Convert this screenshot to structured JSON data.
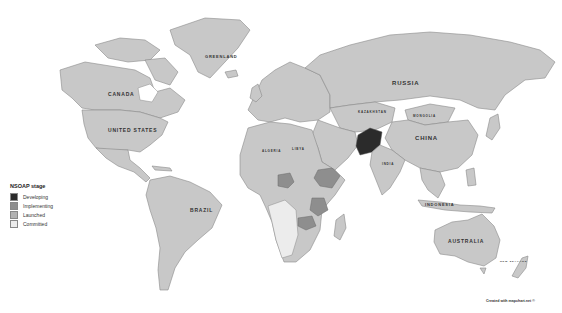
{
  "legend": {
    "title": "NSOAP stage",
    "items": [
      {
        "label": "Developing",
        "color": "#2b2b2b"
      },
      {
        "label": "Implementing",
        "color": "#8e8e8e"
      },
      {
        "label": "Launched",
        "color": "#b2b2b2"
      },
      {
        "label": "Committed",
        "color": "#ececec"
      }
    ]
  },
  "labels": {
    "greenland": "GREENLAND",
    "canada": "CANADA",
    "united_states": "UNITED STATES",
    "russia": "RUSSIA",
    "kazakhstan": "KAZAKHSTAN",
    "mongolia": "MONGOLIA",
    "china": "CHINA",
    "india": "INDIA",
    "brazil": "BRAZIL",
    "indonesia": "INDONESIA",
    "australia": "AUSTRALIA",
    "new_zealand": "NEW ZEALAND",
    "algeria": "ALGERIA",
    "libya": "LIBYA"
  },
  "highlighted_countries": {
    "developing": [
      "Pakistan"
    ],
    "implementing": [
      "Nigeria",
      "Ethiopia",
      "Tanzania",
      "Zambia"
    ]
  },
  "credit": "Created with mapchart.net ©"
}
